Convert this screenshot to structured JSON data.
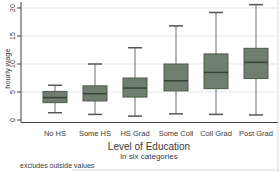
{
  "chart_data": {
    "type": "box",
    "title": "",
    "xlabel": "Level of Education",
    "xlabel_subtitle": "in six categories",
    "ylabel": "hourly wage",
    "note": "excludes outside values",
    "categories": [
      "No HS",
      "Some HS",
      "HS Grad",
      "Some Coll",
      "Coll Grad",
      "Post Grad"
    ],
    "y_ticks": [
      0,
      5,
      10,
      15,
      20
    ],
    "ylim": [
      0,
      21
    ],
    "grid": true,
    "legend": "none",
    "boxes": [
      {
        "category": "No HS",
        "lower_whisker": 1.3,
        "q1": 3.1,
        "median": 4.0,
        "q3": 5.1,
        "upper_whisker": 6.2
      },
      {
        "category": "Some HS",
        "lower_whisker": 1.0,
        "q1": 3.4,
        "median": 4.7,
        "q3": 6.1,
        "upper_whisker": 10.0
      },
      {
        "category": "HS Grad",
        "lower_whisker": 0.7,
        "q1": 4.1,
        "median": 5.7,
        "q3": 7.5,
        "upper_whisker": 12.9
      },
      {
        "category": "Some Coll",
        "lower_whisker": 1.1,
        "q1": 5.2,
        "median": 7.0,
        "q3": 10.0,
        "upper_whisker": 16.8
      },
      {
        "category": "Coll Grad",
        "lower_whisker": 1.0,
        "q1": 5.6,
        "median": 8.5,
        "q3": 11.8,
        "upper_whisker": 19.2
      },
      {
        "category": "Post Grad",
        "lower_whisker": 0.9,
        "q1": 7.4,
        "median": 10.3,
        "q3": 12.8,
        "upper_whisker": 20.6
      }
    ],
    "colors": {
      "box_fill": "#6f7e6e",
      "box_stroke": "#4c5a4b",
      "median": "#374337",
      "whisker": "#6e6e6e",
      "whisker_cap": "#555555",
      "grid": "#e2e9ee",
      "axis": "#404040",
      "text": "#3a3a3a",
      "window_edge": "#d9d9d9"
    }
  }
}
